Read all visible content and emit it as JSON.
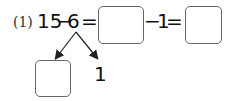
{
  "problem": {
    "label": "(1)",
    "minuend": "15",
    "minus1": "−",
    "subtrahend": "6",
    "equals1": "=",
    "answer_box_1": "",
    "minus2": "−",
    "second_subtrahend": "1",
    "equals2": "=",
    "answer_box_2": ""
  },
  "decomposition": {
    "left_box": "",
    "right_value": "1"
  },
  "colors": {
    "text": "#111111",
    "box_border": "#666666",
    "arrow": "#222222"
  }
}
